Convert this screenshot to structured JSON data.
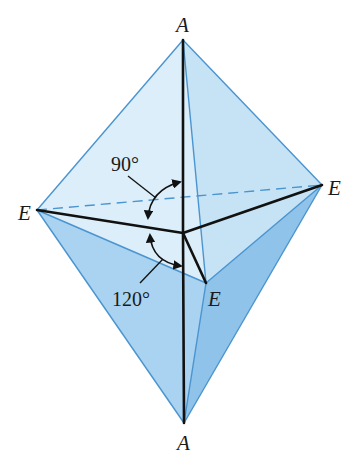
{
  "figure": {
    "vertices": {
      "axial_top": {
        "label": "A",
        "x": 183,
        "y": 40
      },
      "axial_bottom": {
        "label": "A",
        "x": 184,
        "y": 423
      },
      "equatorial_left": {
        "label": "E",
        "x": 37,
        "y": 210
      },
      "equatorial_right": {
        "label": "E",
        "x": 322,
        "y": 185
      },
      "equatorial_front": {
        "label": "E",
        "x": 206,
        "y": 283
      },
      "center": {
        "x": 183,
        "y": 233
      }
    },
    "labels": {
      "top_a": "A",
      "bottom_a": "A",
      "left_e": "E",
      "right_e": "E",
      "front_e": "E",
      "angle_axial_equatorial": "90°",
      "angle_equatorial_equatorial": "120°"
    },
    "colors": {
      "light_face": "#d6ebf8",
      "mid_face": "#b6daf2",
      "dark_face": "#8fc3e9",
      "edge_blue": "#4a94cf",
      "bond": "#111111"
    }
  }
}
